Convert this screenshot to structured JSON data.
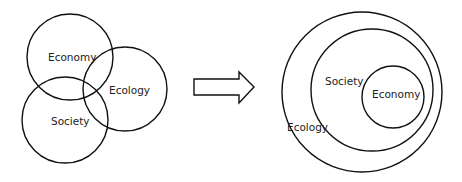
{
  "left_diagram": {
    "labels": {
      "economy": "Economy",
      "ecology": "Ecology",
      "society": "Society"
    }
  },
  "arrow": {
    "direction": "right"
  },
  "right_diagram": {
    "labels": {
      "ecology": "Ecology",
      "society": "Society",
      "economy": "Economy"
    }
  },
  "colors": {
    "stroke": "#111111",
    "background": "#ffffff"
  }
}
